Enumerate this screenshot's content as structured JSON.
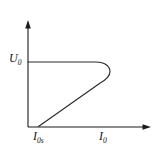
{
  "figure": {
    "title": "",
    "background_color": "#ffffff",
    "line_color": "#2a2a2a",
    "axis_color": "#1b1b1b",
    "width": 162,
    "height": 152
  },
  "axes": {
    "y_axis": {
      "label_main": "U",
      "label_sub": "0",
      "label_full": "U0",
      "has_arrow": true,
      "arrow_direction": "up",
      "origin_x": 28,
      "top_y": 22,
      "bottom_y": 127
    },
    "x_axis": {
      "label_main": "I",
      "label_sub": "0",
      "label_full": "I0",
      "has_arrow": true,
      "arrow_direction": "right",
      "origin_y": 127,
      "left_x": 28,
      "right_x": 150
    },
    "x_tick_label": {
      "label_main": "I",
      "label_sub": "0s",
      "label_full": "I0s",
      "position_x": 38
    }
  },
  "chart_data": {
    "type": "line",
    "title": "",
    "xlabel": "I0",
    "ylabel": "U0",
    "grid": false,
    "legend": null,
    "annotations": [
      {
        "text": "U0",
        "role": "y-axis-label",
        "anchor": "y-axis-top-value"
      },
      {
        "text": "I0s",
        "role": "x-axis-tick-label",
        "anchor": "curve-x-intercept"
      },
      {
        "text": "I0",
        "role": "x-axis-label",
        "anchor": "x-axis-right"
      }
    ],
    "series": [
      {
        "name": "negative-resistance-characteristic",
        "description": "Horizontal plateau at U0 from the voltage axis, rounded knee at maximum current, then straight descending branch meeting the current axis at I0s",
        "points": [
          {
            "x": 28,
            "y": 62
          },
          {
            "x": 95,
            "y": 62
          },
          {
            "x": 104,
            "y": 63
          },
          {
            "x": 109,
            "y": 67
          },
          {
            "x": 110,
            "y": 72
          },
          {
            "x": 107,
            "y": 77
          },
          {
            "x": 100,
            "y": 82
          },
          {
            "x": 80,
            "y": 96
          },
          {
            "x": 60,
            "y": 110
          },
          {
            "x": 40,
            "y": 124
          },
          {
            "x": 38,
            "y": 127
          }
        ],
        "path_d": "M 28 62 L 96 62 C 104.5 62 110 66 110 71.5 C 110 77 105 80.5 99.5 83.5 L 38.5 126.5"
      }
    ],
    "axis_ranges": {
      "x": [
        28,
        150
      ],
      "y": [
        127,
        22
      ]
    }
  }
}
